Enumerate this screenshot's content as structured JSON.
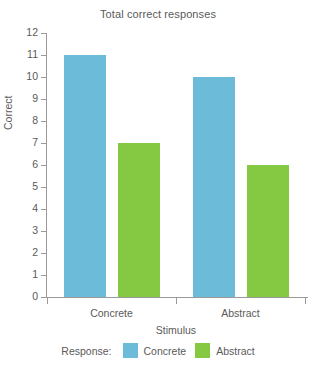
{
  "chart_data": {
    "type": "bar",
    "title": "Total correct responses",
    "xlabel": "Stimulus",
    "ylabel": "Correct",
    "categories": [
      "Concrete",
      "Abstract"
    ],
    "series": [
      {
        "name": "Concrete",
        "color": "#6CBBD9",
        "values": [
          11,
          10
        ]
      },
      {
        "name": "Abstract",
        "color": "#84C941",
        "values": [
          7,
          6
        ]
      }
    ],
    "ylim": [
      0,
      12
    ],
    "ytick_labels": [
      "12",
      "11",
      "10",
      "9",
      "8",
      "7",
      "6",
      "5",
      "4",
      "3",
      "2",
      "1",
      "0"
    ],
    "ytick_values": [
      12,
      11,
      10,
      9,
      8,
      7,
      6,
      5,
      4,
      3,
      2,
      1,
      0
    ],
    "grid": false,
    "legend_title": "Response:",
    "legend_position": "bottom"
  }
}
